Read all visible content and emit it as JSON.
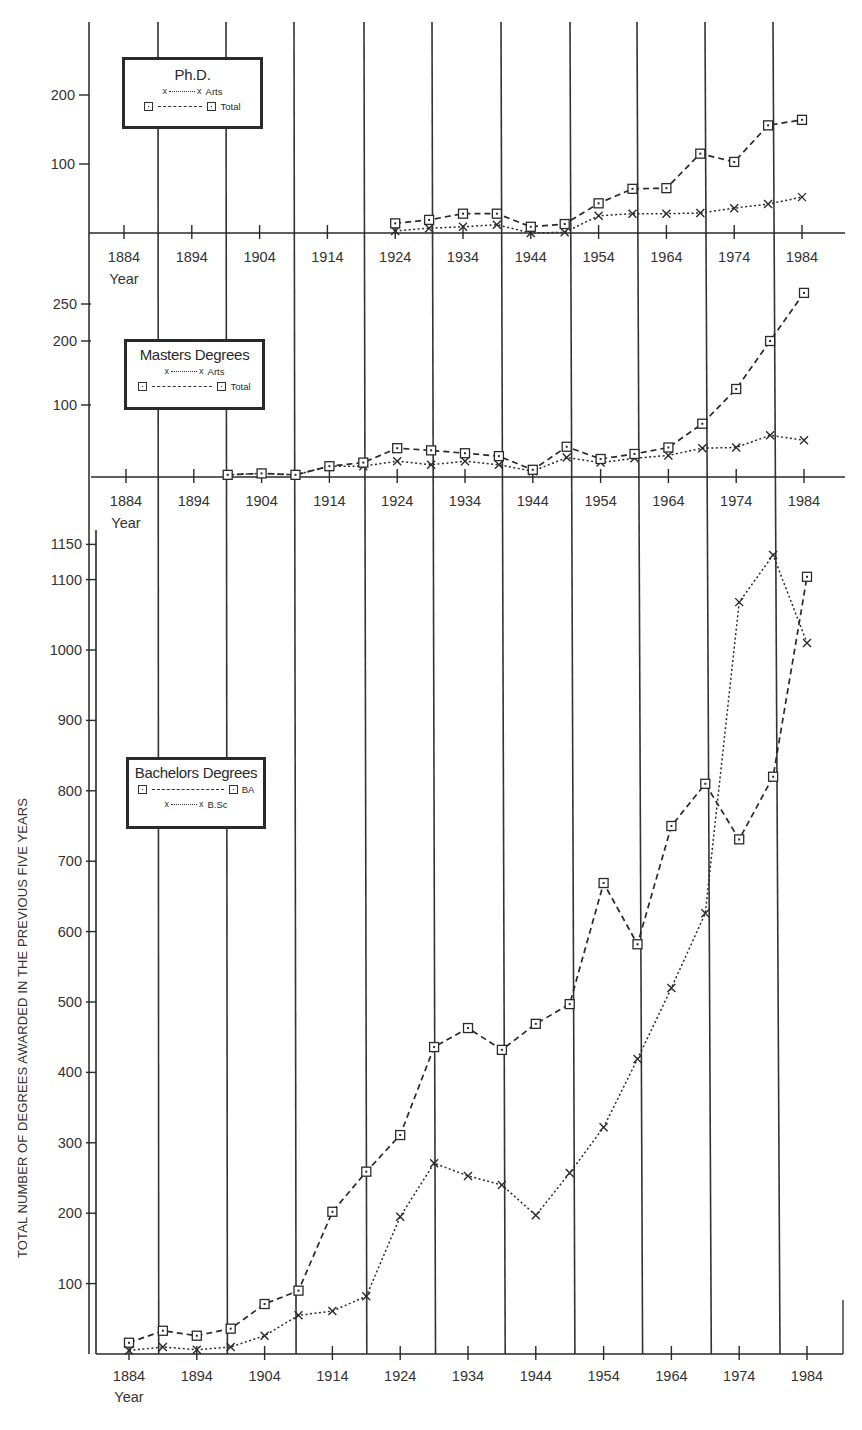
{
  "chart_data": [
    {
      "type": "line",
      "title": "Ph.D.",
      "xlabel": "Year",
      "ylabel": "",
      "x_ticks": [
        "1884",
        "1894",
        "1904",
        "1914",
        "1924",
        "1934",
        "1944",
        "1954",
        "1964",
        "1974",
        "1984"
      ],
      "y_ticks": [
        100,
        200
      ],
      "ylim": [
        0,
        300
      ],
      "grid": "vertical lines every 10 years (offset 5 years from ticks)",
      "legend": [
        "x------x Arts",
        "□ — — — □ Total"
      ],
      "legend_position": "upper-left",
      "x": [
        1924,
        1929,
        1934,
        1939,
        1944,
        1949,
        1954,
        1959,
        1964,
        1969,
        1974,
        1979,
        1984
      ],
      "series": [
        {
          "name": "Arts",
          "marker": "x",
          "line": "dotted",
          "values": [
            3,
            7,
            9,
            12,
            0,
            1,
            25,
            28,
            28,
            29,
            36,
            42,
            52
          ]
        },
        {
          "name": "Total",
          "marker": "square",
          "line": "dashed",
          "values": [
            14,
            19,
            28,
            28,
            9,
            13,
            43,
            64,
            65,
            115,
            103,
            156,
            164
          ]
        }
      ]
    },
    {
      "type": "line",
      "title": "Masters Degrees",
      "xlabel": "Year",
      "ylabel": "",
      "x_ticks": [
        "1884",
        "1894",
        "1904",
        "1914",
        "1924",
        "1934",
        "1944",
        "1954",
        "1964",
        "1974",
        "1984"
      ],
      "y_ticks": [
        100,
        200,
        250
      ],
      "ylim": [
        0,
        280
      ],
      "legend": [
        "x------x Arts",
        "□ — — — — □ Total"
      ],
      "legend_position": "upper-left",
      "x": [
        1899,
        1904,
        1909,
        1914,
        1919,
        1924,
        1929,
        1934,
        1939,
        1944,
        1949,
        1954,
        1959,
        1964,
        1969,
        1974,
        1979,
        1984
      ],
      "series": [
        {
          "name": "Arts",
          "marker": "x",
          "line": "dotted",
          "values": [
            3,
            5,
            3,
            15,
            15,
            22,
            17,
            22,
            17,
            8,
            27,
            20,
            26,
            30,
            40,
            41,
            58,
            51
          ]
        },
        {
          "name": "Total",
          "marker": "square",
          "line": "dashed",
          "values": [
            3,
            5,
            3,
            15,
            20,
            40,
            37,
            33,
            29,
            10,
            42,
            25,
            32,
            41,
            74,
            125,
            200,
            265
          ]
        }
      ]
    },
    {
      "type": "line",
      "title": "Bachelors Degrees",
      "xlabel": "Year",
      "ylabel": "TOTAL NUMBER OF DEGREES AWARDED IN THE PREVIOUS FIVE YEARS",
      "x_ticks": [
        "1884",
        "1894",
        "1904",
        "1914",
        "1924",
        "1934",
        "1944",
        "1954",
        "1964",
        "1974",
        "1984"
      ],
      "y_ticks": [
        100,
        200,
        300,
        400,
        500,
        600,
        700,
        800,
        900,
        1000,
        1100,
        1150
      ],
      "ylim": [
        0,
        1150
      ],
      "legend": [
        "□ — — — — — □ BA",
        "x------x B.Sc"
      ],
      "legend_position": "middle-left",
      "x": [
        1884,
        1889,
        1894,
        1899,
        1904,
        1909,
        1914,
        1919,
        1924,
        1929,
        1934,
        1939,
        1944,
        1949,
        1954,
        1959,
        1964,
        1969,
        1974,
        1979,
        1984
      ],
      "series": [
        {
          "name": "BA",
          "marker": "square",
          "line": "dashed",
          "values": [
            16,
            33,
            26,
            36,
            71,
            90,
            202,
            259,
            311,
            436,
            463,
            432,
            469,
            497,
            669,
            582,
            750,
            810,
            731,
            820,
            1104
          ]
        },
        {
          "name": "B.Sc",
          "marker": "x",
          "line": "dotted",
          "values": [
            5,
            10,
            6,
            10,
            26,
            55,
            61,
            82,
            195,
            271,
            253,
            240,
            197,
            257,
            322,
            419,
            520,
            626,
            1068,
            1135,
            1010
          ]
        }
      ]
    }
  ],
  "labels": {
    "year_word": "Year",
    "y_axis_title": "TOTAL NUMBER OF DEGREES AWARDED IN THE PREVIOUS FIVE YEARS",
    "phd": {
      "title": "Ph.D.",
      "arts": "Arts",
      "total": "Total"
    },
    "masters": {
      "title": "Masters Degrees",
      "arts": "Arts",
      "total": "Total"
    },
    "bachelors": {
      "title": "Bachelors Degrees",
      "ba": "BA",
      "bsc": "B.Sc"
    }
  },
  "colors": {
    "ink": "#2a2a2a",
    "grid": "#333333",
    "background": "#ffffff"
  }
}
